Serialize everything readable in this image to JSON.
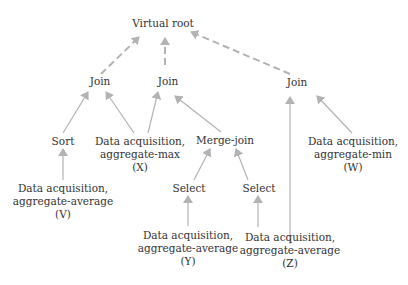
{
  "colors": {
    "edge": "#b3b3b3",
    "text": "#333333",
    "background": "#ffffff"
  },
  "nodes": {
    "root": {
      "label": "Virtual root"
    },
    "join1": {
      "label": "Join"
    },
    "join2": {
      "label": "Join"
    },
    "join3": {
      "label": "Join"
    },
    "sort": {
      "label": "Sort"
    },
    "acq_x": {
      "line1": "Data acquisition,",
      "line2": "aggregate-max",
      "line3": "(X)"
    },
    "merge": {
      "label": "Merge-join"
    },
    "acq_w": {
      "line1": "Data acquisition,",
      "line2": "aggregate-min",
      "line3": "(W)"
    },
    "acq_v": {
      "line1": "Data acquisition,",
      "line2": "aggregate-average",
      "line3": "(V)"
    },
    "select1": {
      "label": "Select"
    },
    "select2": {
      "label": "Select"
    },
    "acq_y": {
      "line1": "Data acquisition,",
      "line2": "aggregate-average",
      "line3": "(Y)"
    },
    "acq_z": {
      "line1": "Data acquisition,",
      "line2": "aggregate-average",
      "line3": "(Z)"
    }
  },
  "edges": [
    {
      "from": "join1",
      "to": "root",
      "style": "dashed"
    },
    {
      "from": "join2",
      "to": "root",
      "style": "dashed"
    },
    {
      "from": "join3",
      "to": "root",
      "style": "dashed"
    },
    {
      "from": "sort",
      "to": "join1",
      "style": "solid"
    },
    {
      "from": "acq_x",
      "to": "join1",
      "style": "solid"
    },
    {
      "from": "acq_x",
      "to": "join2",
      "style": "solid"
    },
    {
      "from": "merge",
      "to": "join2",
      "style": "solid"
    },
    {
      "from": "acq_z",
      "to": "join3",
      "style": "solid"
    },
    {
      "from": "acq_w",
      "to": "join3",
      "style": "solid"
    },
    {
      "from": "acq_v",
      "to": "sort",
      "style": "solid"
    },
    {
      "from": "select1",
      "to": "merge",
      "style": "solid"
    },
    {
      "from": "select2",
      "to": "merge",
      "style": "solid"
    },
    {
      "from": "acq_y",
      "to": "select1",
      "style": "solid"
    },
    {
      "from": "acq_z",
      "to": "select2",
      "style": "solid"
    }
  ]
}
